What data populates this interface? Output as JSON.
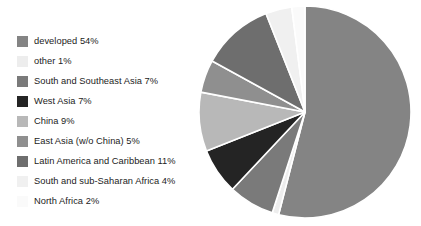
{
  "chart_data": {
    "type": "pie",
    "title": "",
    "xlabel": "",
    "ylabel": "",
    "legend_position": "left",
    "grid": false,
    "units": "percent",
    "start_angle_deg": 0,
    "direction": "clockwise",
    "total": 100,
    "categories": [
      "developed",
      "other",
      "South and Southeast Asia",
      "West Asia",
      "China",
      "East Asia (w/o China)",
      "Latin America and Caribbean",
      "South and sub-Saharan Africa",
      "North Africa"
    ],
    "values": [
      54,
      1,
      7,
      7,
      9,
      5,
      11,
      4,
      2
    ],
    "slices": [
      {
        "label": "developed",
        "value": 54,
        "value_text": "54%",
        "color": "#848484",
        "legend_text": "developed 54%"
      },
      {
        "label": "other",
        "value": 1,
        "value_text": "1%",
        "color": "#ededed",
        "legend_text": "other 1%"
      },
      {
        "label": "South and Southeast Asia",
        "value": 7,
        "value_text": "7%",
        "color": "#7a7a7a",
        "legend_text": "South and Southeast Asia 7%"
      },
      {
        "label": "West Asia",
        "value": 7,
        "value_text": "7%",
        "color": "#242424",
        "legend_text": "West Asia 7%"
      },
      {
        "label": "China",
        "value": 9,
        "value_text": "9%",
        "color": "#b8b8b8",
        "legend_text": "China 9%"
      },
      {
        "label": "East Asia (w/o China)",
        "value": 5,
        "value_text": "5%",
        "color": "#8f8f8f",
        "legend_text": "East Asia (w/o China) 5%"
      },
      {
        "label": "Latin America and Caribbean",
        "value": 11,
        "value_text": "11%",
        "color": "#6e6e6e",
        "legend_text": "Latin America and Caribbean 11%"
      },
      {
        "label": "South and sub-Saharan Africa",
        "value": 4,
        "value_text": "4%",
        "color": "#f0f0f0",
        "legend_text": "South and sub-Saharan Africa 4%"
      },
      {
        "label": "North Africa",
        "value": 2,
        "value_text": "2%",
        "color": "#fafafa",
        "legend_text": "North Africa 2%"
      }
    ]
  },
  "legend": {
    "items": [
      {
        "text": "developed 54%",
        "color": "#848484"
      },
      {
        "text": "other 1%",
        "color": "#ededed"
      },
      {
        "text": "South and Southeast Asia 7%",
        "color": "#7a7a7a"
      },
      {
        "text": "West Asia 7%",
        "color": "#242424"
      },
      {
        "text": "China 9%",
        "color": "#b8b8b8"
      },
      {
        "text": "East Asia (w/o China) 5%",
        "color": "#8f8f8f"
      },
      {
        "text": "Latin America and Caribbean 11%",
        "color": "#6e6e6e"
      },
      {
        "text": "South and sub-Saharan Africa 4%",
        "color": "#f0f0f0"
      },
      {
        "text": "North Africa 2%",
        "color": "#fafafa"
      }
    ]
  },
  "pie_geometry": {
    "center_x": 107,
    "center_y": 107,
    "radius": 106,
    "separator_color": "#ffffff",
    "separator_width": 1.6
  }
}
